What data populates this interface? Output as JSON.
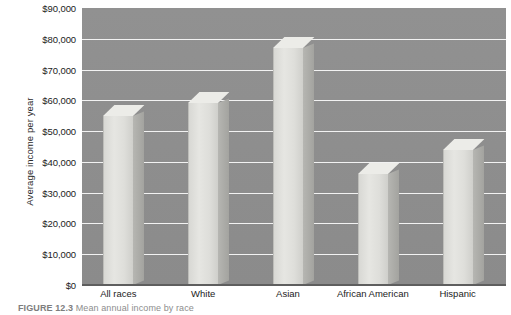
{
  "figure": {
    "caption_label": "FIGURE 12.3",
    "caption_text": "Mean annual income by race"
  },
  "chart_data": {
    "type": "bar",
    "title": "",
    "subtitle": "",
    "xlabel": "",
    "ylabel": "Average income per year",
    "categories": [
      "All races",
      "White",
      "Asian",
      "African American",
      "Hispanic"
    ],
    "values": [
      55000,
      59000,
      77000,
      36000,
      44000
    ],
    "series": [
      {
        "name": "Average income per year",
        "values": [
          55000,
          59000,
          77000,
          36000,
          44000
        ]
      }
    ],
    "ylim": [
      0,
      90000
    ],
    "ytick_values": [
      0,
      10000,
      20000,
      30000,
      40000,
      50000,
      60000,
      70000,
      80000,
      90000
    ],
    "ytick_labels": [
      "$0",
      "$10,000",
      "$20,000",
      "$30,000",
      "$40,000",
      "$50,000",
      "$60,000",
      "$70,000",
      "$80,000",
      "$90,000"
    ],
    "grid": true,
    "legend": false,
    "legend_position": "none",
    "style_3d": true,
    "colors": {
      "plot_background": "#8f8f8f",
      "gridline": "#f2f2f2",
      "bar_face": "#e2e2de",
      "bar_side": "#acaca8",
      "bar_top": "#ecece8",
      "axis_text": "#1b1b1b",
      "caption_text": "#8d8d8d"
    }
  }
}
